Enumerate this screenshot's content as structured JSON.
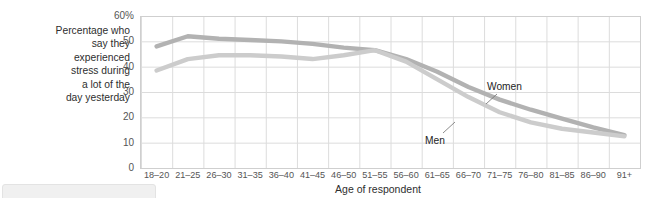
{
  "axis": {
    "y_caption": "Percentage who\nsay they\nexperienced\nstress during\na lot of the\nday yesterday",
    "x_title": "Age of respondent"
  },
  "colors": {
    "women_line": "#b2b2b2",
    "men_line": "#cccccc",
    "grid": "#dcdcdc",
    "plot_border": "#cfcfcf",
    "text": "#3c3c3c",
    "panel": "#f0f0f0"
  },
  "chart_data": {
    "type": "line",
    "title": "",
    "xlabel": "Age of respondent",
    "ylabel": "Percentage who say they experienced stress during a lot of the day yesterday",
    "categories": [
      "18–20",
      "21–25",
      "26–30",
      "31–35",
      "36–40",
      "41–45",
      "46–50",
      "51–55",
      "56–60",
      "61–65",
      "66–70",
      "71–75",
      "76–80",
      "81–85",
      "86–90",
      "91+"
    ],
    "ylim": [
      0,
      60
    ],
    "yticks": [
      0,
      10,
      20,
      30,
      40,
      50,
      60
    ],
    "ytick_labels": [
      "0",
      "10",
      "20",
      "30",
      "40",
      "50",
      "60%"
    ],
    "grid": true,
    "legend_position": "inline-annotation",
    "series": [
      {
        "name": "Women",
        "color": "#b2b2b2",
        "values": [
          48,
          52,
          51,
          50.5,
          50,
          49,
          47.5,
          46.5,
          43,
          38,
          32,
          27,
          23,
          19.5,
          16,
          13
        ]
      },
      {
        "name": "Men",
        "color": "#cccccc",
        "values": [
          38.5,
          43,
          44.5,
          44.5,
          44,
          43,
          44.5,
          46.5,
          42,
          35,
          28,
          22,
          18,
          15.5,
          14,
          12.5
        ]
      }
    ],
    "annotations": [
      {
        "text": "Women",
        "series": "Women"
      },
      {
        "text": "Men",
        "series": "Men"
      }
    ]
  }
}
